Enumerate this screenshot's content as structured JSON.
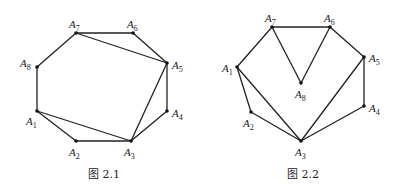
{
  "figures": [
    {
      "id": "fig-2-1",
      "caption": "图 2.1",
      "caption_pos": [
        104,
        178
      ],
      "vertices": [
        {
          "name": "A1",
          "letter": "A",
          "sub": "1",
          "x": 37,
          "y": 111,
          "lx": 26,
          "ly": 125
        },
        {
          "name": "A2",
          "letter": "A",
          "sub": "2",
          "x": 76,
          "y": 141,
          "lx": 69,
          "ly": 156
        },
        {
          "name": "A3",
          "letter": "A",
          "sub": "3",
          "x": 131,
          "y": 141,
          "lx": 124,
          "ly": 156
        },
        {
          "name": "A4",
          "letter": "A",
          "sub": "4",
          "x": 167,
          "y": 111,
          "lx": 172,
          "ly": 117
        },
        {
          "name": "A5",
          "letter": "A",
          "sub": "5",
          "x": 167,
          "y": 63,
          "lx": 172,
          "ly": 69
        },
        {
          "name": "A6",
          "letter": "A",
          "sub": "6",
          "x": 133,
          "y": 33,
          "lx": 127,
          "ly": 28
        },
        {
          "name": "A7",
          "letter": "A",
          "sub": "7",
          "x": 76,
          "y": 33,
          "lx": 69,
          "ly": 28
        },
        {
          "name": "A8",
          "letter": "A",
          "sub": "8",
          "x": 37,
          "y": 67,
          "lx": 20,
          "ly": 67
        }
      ],
      "edges": [
        [
          "A1",
          "A2"
        ],
        [
          "A2",
          "A3"
        ],
        [
          "A3",
          "A4"
        ],
        [
          "A4",
          "A5"
        ],
        [
          "A5",
          "A6"
        ],
        [
          "A6",
          "A7"
        ],
        [
          "A7",
          "A8"
        ],
        [
          "A8",
          "A1"
        ],
        [
          "A1",
          "A3"
        ],
        [
          "A3",
          "A5"
        ],
        [
          "A5",
          "A7"
        ]
      ]
    },
    {
      "id": "fig-2-2",
      "caption": "图 2.2",
      "caption_pos": [
        303,
        178
      ],
      "vertices": [
        {
          "name": "A1",
          "letter": "A",
          "sub": "1",
          "x": 237,
          "y": 67,
          "lx": 222,
          "ly": 72
        },
        {
          "name": "A2",
          "letter": "A",
          "sub": "2",
          "x": 251,
          "y": 112,
          "lx": 243,
          "ly": 127
        },
        {
          "name": "A3",
          "letter": "A",
          "sub": "3",
          "x": 301,
          "y": 141,
          "lx": 295,
          "ly": 156
        },
        {
          "name": "A4",
          "letter": "A",
          "sub": "4",
          "x": 364,
          "y": 106,
          "lx": 369,
          "ly": 112
        },
        {
          "name": "A5",
          "letter": "A",
          "sub": "5",
          "x": 364,
          "y": 57,
          "lx": 369,
          "ly": 62
        },
        {
          "name": "A6",
          "letter": "A",
          "sub": "6",
          "x": 330,
          "y": 27,
          "lx": 324,
          "ly": 22
        },
        {
          "name": "A7",
          "letter": "A",
          "sub": "7",
          "x": 272,
          "y": 27,
          "lx": 265,
          "ly": 22
        },
        {
          "name": "A8",
          "letter": "A",
          "sub": "8",
          "x": 301,
          "y": 83,
          "lx": 295,
          "ly": 98
        }
      ],
      "edges": [
        [
          "A1",
          "A2"
        ],
        [
          "A2",
          "A3"
        ],
        [
          "A3",
          "A4"
        ],
        [
          "A4",
          "A5"
        ],
        [
          "A5",
          "A6"
        ],
        [
          "A6",
          "A7"
        ],
        [
          "A7",
          "A1"
        ],
        [
          "A1",
          "A3"
        ],
        [
          "A3",
          "A5"
        ],
        [
          "A7",
          "A8"
        ],
        [
          "A8",
          "A6"
        ]
      ]
    }
  ],
  "colors": {
    "line": "#222222",
    "vertex": "#111111",
    "background": "#ffffff"
  }
}
